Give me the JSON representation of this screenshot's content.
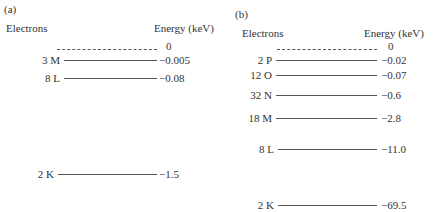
{
  "panels": {
    "a": {
      "label": "(a)",
      "col_left": "Electrons",
      "col_right": "Energy (keV)",
      "zero_label": "0",
      "levels": [
        {
          "shell": "3 M",
          "energy": "−0.005"
        },
        {
          "shell": "8 L",
          "energy": "−0.08"
        },
        {
          "shell": "2 K",
          "energy": "−1.5"
        }
      ]
    },
    "b": {
      "label": "(b)",
      "col_left": "Electrons",
      "col_right": "Energy (keV)",
      "zero_label": "0",
      "levels": [
        {
          "shell": "2 P",
          "energy": "−0.02"
        },
        {
          "shell": "12 O",
          "energy": "−0.07"
        },
        {
          "shell": "32 N",
          "energy": "−0.6"
        },
        {
          "shell": "18 M",
          "energy": "−2.8"
        },
        {
          "shell": "8 L",
          "energy": "−11.0"
        },
        {
          "shell": "2 K",
          "energy": "−69.5"
        }
      ]
    }
  }
}
